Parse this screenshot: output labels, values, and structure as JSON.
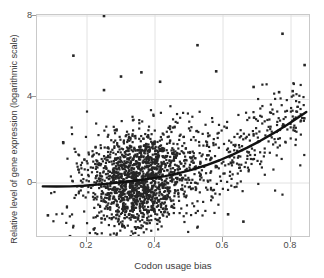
{
  "figure": {
    "kind": "scatter-plot-with-trend-line",
    "background_color": "#ffffff",
    "panel_border_color": "#c9c9c9",
    "grid_color": "#e2e2e2",
    "point_color": "#262626",
    "trend_line_color": "#111111"
  },
  "axes": {
    "xlabel": "Codon usage bias",
    "ylabel": "Relative level of gene expression (logarithmic scale)",
    "xticks": [
      "0.2",
      "0.4",
      "0.6",
      "0.8"
    ],
    "yticks": [
      "0",
      "4",
      "8"
    ]
  },
  "chart_data": {
    "type": "scatter",
    "title": "",
    "xlabel": "Codon usage bias",
    "ylabel": "Relative level of gene expression (logarithmic scale)",
    "xlim": [
      0.06,
      0.87
    ],
    "ylim": [
      -3.9,
      8.6
    ],
    "xticks": [
      0.2,
      0.4,
      0.6,
      0.8
    ],
    "yticks": [
      0,
      4,
      8
    ],
    "grid": true,
    "grid_orientation": "both",
    "legend": "none",
    "marker": "square",
    "marker_size_px": 2.2,
    "point_color": "#262626",
    "n_points_drawn": 1700,
    "annotations": [
      "Dense central cluster of genes near codon usage bias 0.25-0.40 and expression level 0",
      "Positive, upward-curving relationship: expression rises steeply above bias 0.5",
      "Extreme high outlier near (0.25, 8.0)"
    ],
    "density_model": {
      "description": "Points are generated from a 2-D distribution whose centre follows the trend curve; spread shrinks and mean rises with x.",
      "x_distribution": "right-skewed, mode 0.31, range 0.07-0.85",
      "y_spread_at_low_x": 1.35,
      "y_spread_at_high_x": 1.05
    },
    "trend_line": {
      "label": "LOESS / quadratic fit",
      "width_px": 2.4,
      "points": [
        [
          0.07,
          -0.16
        ],
        [
          0.11,
          -0.17
        ],
        [
          0.15,
          -0.16
        ],
        [
          0.19,
          -0.13
        ],
        [
          0.23,
          -0.08
        ],
        [
          0.27,
          -0.02
        ],
        [
          0.31,
          0.05
        ],
        [
          0.35,
          0.13
        ],
        [
          0.39,
          0.22
        ],
        [
          0.43,
          0.33
        ],
        [
          0.47,
          0.47
        ],
        [
          0.51,
          0.64
        ],
        [
          0.55,
          0.85
        ],
        [
          0.59,
          1.09
        ],
        [
          0.63,
          1.37
        ],
        [
          0.67,
          1.68
        ],
        [
          0.71,
          2.02
        ],
        [
          0.75,
          2.4
        ],
        [
          0.79,
          2.8
        ],
        [
          0.82,
          3.13
        ],
        [
          0.845,
          3.4
        ]
      ]
    },
    "highlight_points": [
      [
        0.25,
        8.0
      ],
      [
        0.16,
        6.1
      ],
      [
        0.525,
        6.6
      ],
      [
        0.775,
        7.15
      ],
      [
        0.84,
        5.65
      ],
      [
        0.58,
        5.35
      ],
      [
        0.36,
        5.3
      ],
      [
        0.3,
        5.1
      ],
      [
        0.415,
        4.85
      ],
      [
        0.25,
        4.45
      ],
      [
        0.69,
        4.6
      ],
      [
        0.805,
        4.4
      ],
      [
        0.765,
        4.35
      ],
      [
        0.13,
        1.95
      ],
      [
        0.085,
        -1.55
      ],
      [
        0.32,
        -3.5
      ],
      [
        0.215,
        -3.45
      ],
      [
        0.15,
        -2.55
      ],
      [
        0.66,
        -1.85
      ],
      [
        0.615,
        -1.5
      ]
    ]
  }
}
